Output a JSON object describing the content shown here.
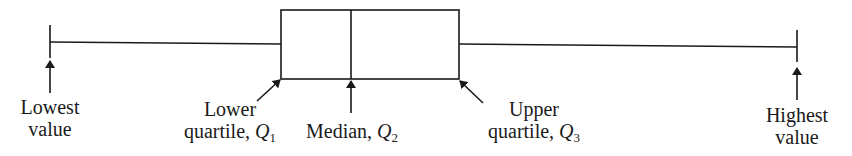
{
  "diagram": {
    "type": "box-and-whisker",
    "labels": {
      "lowest": [
        "Lowest",
        "value"
      ],
      "lower_quartile": {
        "line1": "Lower",
        "line2": "quartile, ",
        "symbol": "Q",
        "subscript": "1"
      },
      "median": {
        "text": "Median, ",
        "symbol": "Q",
        "subscript": "2"
      },
      "upper_quartile": {
        "line1": "Upper",
        "line2": "quartile, ",
        "symbol": "Q",
        "subscript": "3"
      },
      "highest": [
        "Highest",
        "value"
      ]
    },
    "stroke_color": "#1a1a1a"
  }
}
